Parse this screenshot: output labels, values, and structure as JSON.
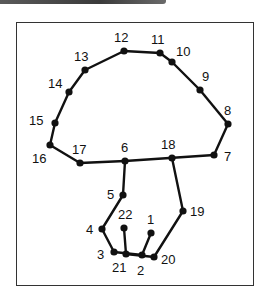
{
  "colors": {
    "line": "#111111",
    "dot": "#111111",
    "border": "#333333",
    "topbar": "#444444"
  },
  "points": [
    {
      "n": "1",
      "x": 151,
      "y": 233,
      "lx": 147,
      "ly": 224
    },
    {
      "n": "2",
      "x": 142,
      "y": 255,
      "lx": 137,
      "ly": 275
    },
    {
      "n": "3",
      "x": 114,
      "y": 252,
      "lx": 97,
      "ly": 259
    },
    {
      "n": "4",
      "x": 102,
      "y": 229,
      "lx": 86,
      "ly": 234
    },
    {
      "n": "5",
      "x": 123,
      "y": 195,
      "lx": 107,
      "ly": 199
    },
    {
      "n": "6",
      "x": 125,
      "y": 161,
      "lx": 121,
      "ly": 152
    },
    {
      "n": "7",
      "x": 214,
      "y": 155,
      "lx": 224,
      "ly": 161
    },
    {
      "n": "8",
      "x": 228,
      "y": 124,
      "lx": 224,
      "ly": 115
    },
    {
      "n": "9",
      "x": 200,
      "y": 90,
      "lx": 202,
      "ly": 81
    },
    {
      "n": "10",
      "x": 172,
      "y": 62,
      "lx": 176,
      "ly": 56
    },
    {
      "n": "11",
      "x": 160,
      "y": 53,
      "lx": 151,
      "ly": 44
    },
    {
      "n": "12",
      "x": 124,
      "y": 51,
      "lx": 114,
      "ly": 42
    },
    {
      "n": "13",
      "x": 85,
      "y": 70,
      "lx": 74,
      "ly": 61
    },
    {
      "n": "14",
      "x": 69,
      "y": 92,
      "lx": 48,
      "ly": 88
    },
    {
      "n": "15",
      "x": 55,
      "y": 123,
      "lx": 29,
      "ly": 125
    },
    {
      "n": "16",
      "x": 50,
      "y": 145,
      "lx": 32,
      "ly": 163
    },
    {
      "n": "17",
      "x": 80,
      "y": 163,
      "lx": 72,
      "ly": 154
    },
    {
      "n": "18",
      "x": 172,
      "y": 158,
      "lx": 161,
      "ly": 149
    },
    {
      "n": "19",
      "x": 183,
      "y": 211,
      "lx": 190,
      "ly": 216
    },
    {
      "n": "20",
      "x": 154,
      "y": 257,
      "lx": 161,
      "ly": 264
    },
    {
      "n": "21",
      "x": 126,
      "y": 254,
      "lx": 112,
      "ly": 272
    },
    {
      "n": "22",
      "x": 124,
      "y": 228,
      "lx": 118,
      "ly": 219
    }
  ],
  "segments": [
    [
      "1",
      "2"
    ],
    [
      "2",
      "3"
    ],
    [
      "3",
      "4"
    ],
    [
      "4",
      "5"
    ],
    [
      "5",
      "6"
    ],
    [
      "6",
      "7"
    ],
    [
      "7",
      "8"
    ],
    [
      "8",
      "9"
    ],
    [
      "9",
      "10"
    ],
    [
      "10",
      "11"
    ],
    [
      "11",
      "12"
    ],
    [
      "12",
      "13"
    ],
    [
      "13",
      "14"
    ],
    [
      "14",
      "15"
    ],
    [
      "15",
      "16"
    ],
    [
      "16",
      "17"
    ],
    [
      "17",
      "6"
    ],
    [
      "18",
      "19"
    ],
    [
      "19",
      "20"
    ],
    [
      "20",
      "21"
    ],
    [
      "21",
      "22"
    ]
  ]
}
